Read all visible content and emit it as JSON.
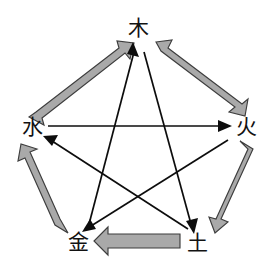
{
  "diagram": {
    "background_color": "#ffffff",
    "nodes": [
      {
        "id": "wood",
        "label": "木",
        "meaning": "Wood",
        "position": "top",
        "x": 138,
        "y": 28
      },
      {
        "id": "fire",
        "label": "火",
        "meaning": "Fire",
        "position": "right",
        "x": 246,
        "y": 127
      },
      {
        "id": "earth",
        "label": "土",
        "meaning": "Earth",
        "position": "bottom-right",
        "x": 197,
        "y": 243
      },
      {
        "id": "metal",
        "label": "金",
        "meaning": "Metal",
        "position": "bottom-left",
        "x": 78,
        "y": 242
      },
      {
        "id": "water",
        "label": "水",
        "meaning": "Water",
        "position": "left",
        "x": 32,
        "y": 127
      }
    ],
    "generating_cycle": {
      "name": "相生",
      "style": "thick-gray-block-arrow",
      "fill_color": "#a9a9a9",
      "stroke_color": "#3d3d3d",
      "edges": [
        {
          "from": "wood",
          "to": "fire"
        },
        {
          "from": "fire",
          "to": "earth"
        },
        {
          "from": "earth",
          "to": "metal"
        },
        {
          "from": "metal",
          "to": "water"
        },
        {
          "from": "water",
          "to": "wood"
        }
      ]
    },
    "overcoming_cycle": {
      "name": "相克",
      "style": "thin-black-line-arrow",
      "stroke_color": "#0d0d0d",
      "edges": [
        {
          "from": "wood",
          "to": "earth"
        },
        {
          "from": "earth",
          "to": "water"
        },
        {
          "from": "water",
          "to": "fire"
        },
        {
          "from": "fire",
          "to": "metal"
        },
        {
          "from": "metal",
          "to": "wood"
        }
      ]
    }
  }
}
